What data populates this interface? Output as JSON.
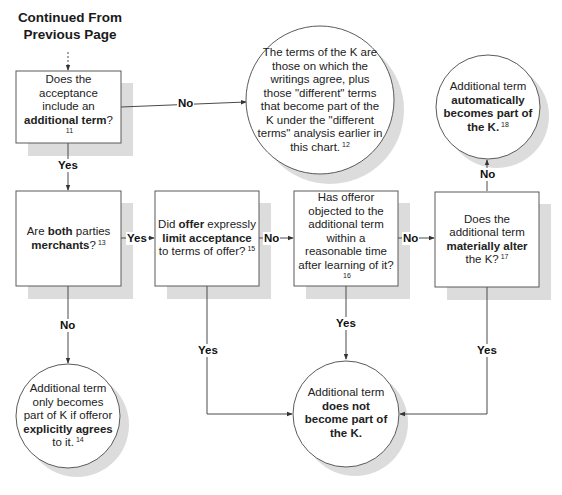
{
  "header": {
    "line1": "Continued From",
    "line2": "Previous Page"
  },
  "nodes": {
    "q_additional_term": {
      "type": "decision-box",
      "parts": [
        {
          "t": "Does the acceptance include an ",
          "b": false
        },
        {
          "t": "additional term",
          "b": true
        },
        {
          "t": "?",
          "b": false
        }
      ],
      "footnote": "11"
    },
    "r_terms_of_k": {
      "type": "result-circle",
      "parts": [
        {
          "t": "The terms of the K are those on which the writings agree, plus those \"different\" terms that become part of the K under the \"different terms\" analysis earlier in this chart.",
          "b": false
        }
      ],
      "footnote": "12"
    },
    "q_both_merchants": {
      "type": "decision-box",
      "parts": [
        {
          "t": "Are ",
          "b": false
        },
        {
          "t": "both",
          "b": true
        },
        {
          "t": " parties ",
          "b": false
        },
        {
          "t": "merchants",
          "b": true
        },
        {
          "t": "?",
          "b": false
        }
      ],
      "footnote": "13"
    },
    "r_explicitly_agrees": {
      "type": "result-circle",
      "parts": [
        {
          "t": "Additional term only becomes part of K if offeror ",
          "b": false
        },
        {
          "t": "explicitly agrees",
          "b": true
        },
        {
          "t": " to it.",
          "b": false
        }
      ],
      "footnote": "14"
    },
    "q_limit_acceptance": {
      "type": "decision-box",
      "parts": [
        {
          "t": "Did ",
          "b": false
        },
        {
          "t": "offer",
          "b": true
        },
        {
          "t": " expressly ",
          "b": false
        },
        {
          "t": "limit acceptance",
          "b": true
        },
        {
          "t": " to terms of offer?",
          "b": false
        }
      ],
      "footnote": "15"
    },
    "q_offeror_objected": {
      "type": "decision-box",
      "parts": [
        {
          "t": "Has offeror objected to the additional term within a reasonable time after learning of it?",
          "b": false
        }
      ],
      "footnote": "16"
    },
    "q_materially_alter": {
      "type": "decision-box",
      "parts": [
        {
          "t": "Does the additional term ",
          "b": false
        },
        {
          "t": "materially alter",
          "b": true
        },
        {
          "t": " the K?",
          "b": false
        }
      ],
      "footnote": "17"
    },
    "r_automatically_part": {
      "type": "result-circle",
      "parts": [
        {
          "t": "Additional term ",
          "b": false
        },
        {
          "t": "automatically becomes part of the K.",
          "b": true
        }
      ],
      "footnote": "18"
    },
    "r_not_part": {
      "type": "result-circle",
      "parts": [
        {
          "t": "Additional term ",
          "b": false
        },
        {
          "t": "does not become part of the K.",
          "b": true
        }
      ],
      "footnote": ""
    }
  },
  "edges": [
    {
      "from": "header",
      "to": "q_additional_term",
      "label": ""
    },
    {
      "from": "q_additional_term",
      "to": "r_terms_of_k",
      "label": "No"
    },
    {
      "from": "q_additional_term",
      "to": "q_both_merchants",
      "label": "Yes"
    },
    {
      "from": "q_both_merchants",
      "to": "q_limit_acceptance",
      "label": "Yes"
    },
    {
      "from": "q_both_merchants",
      "to": "r_explicitly_agrees",
      "label": "No"
    },
    {
      "from": "q_limit_acceptance",
      "to": "q_offeror_objected",
      "label": "No"
    },
    {
      "from": "q_limit_acceptance",
      "to": "r_not_part",
      "label": "Yes"
    },
    {
      "from": "q_offeror_objected",
      "to": "q_materially_alter",
      "label": "No"
    },
    {
      "from": "q_offeror_objected",
      "to": "r_not_part",
      "label": "Yes"
    },
    {
      "from": "q_materially_alter",
      "to": "r_automatically_part",
      "label": "No"
    },
    {
      "from": "q_materially_alter",
      "to": "r_not_part",
      "label": "Yes"
    }
  ],
  "labels": {
    "no": "No",
    "yes": "Yes"
  },
  "colors": {
    "line": "#4a4a4a",
    "shadow": "#dcdcdc",
    "box_border": "#5a5a5a",
    "fill": "#ffffff"
  }
}
